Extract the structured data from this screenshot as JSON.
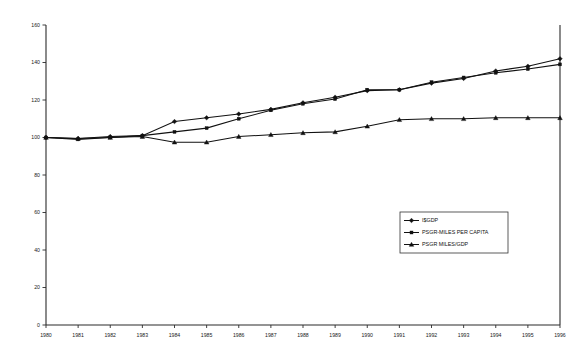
{
  "chart_data": {
    "type": "line",
    "title": "",
    "subtitle": "",
    "xlabel": "",
    "ylabel": "",
    "xlim": [
      1980,
      1996
    ],
    "ylim": [
      0,
      160
    ],
    "grid": false,
    "legend_position": "center-right",
    "x": [
      1980,
      1981,
      1982,
      1983,
      1984,
      1985,
      1986,
      1987,
      1988,
      1989,
      1990,
      1991,
      1992,
      1993,
      1994,
      1995,
      1996
    ],
    "x_tick_labels": [
      "1980",
      "1981",
      "1982",
      "1983",
      "1984",
      "1985",
      "1986",
      "1987",
      "1988",
      "1989",
      "1990",
      "1991",
      "1992",
      "1993",
      "1994",
      "1995",
      "1996"
    ],
    "y_tick_labels": [
      "0",
      "20",
      "40",
      "60",
      "80",
      "100",
      "120",
      "140",
      "160"
    ],
    "y_ticks": [
      0,
      20,
      40,
      60,
      80,
      100,
      120,
      140,
      160
    ],
    "series": [
      {
        "name": "I$GDP",
        "marker": "diamond",
        "values": [
          100,
          99.5,
          100.5,
          101,
          108.5,
          110.5,
          112.5,
          115,
          118.5,
          121.5,
          125,
          125.5,
          129,
          131.5,
          135.5,
          138,
          142
        ]
      },
      {
        "name": "PSGR-MILES PER CAPITA",
        "marker": "square",
        "values": [
          100,
          99,
          100,
          101,
          103,
          105,
          110,
          114.5,
          118,
          120.5,
          125.5,
          125.5,
          129.5,
          132,
          134.5,
          136.5,
          139
        ]
      },
      {
        "name": "PSGR MILES/GDP",
        "marker": "triangle",
        "values": [
          100,
          99.5,
          100,
          100.5,
          97.5,
          97.5,
          100.5,
          101.5,
          102.5,
          103,
          106,
          109.5,
          110,
          110,
          110.5,
          110.5,
          110.5
        ]
      }
    ]
  },
  "legend": {
    "entries": [
      {
        "label": "I$GDP"
      },
      {
        "label": "PSGR-MILES PER CAPITA"
      },
      {
        "label": "PSGR MILES/GDP"
      }
    ]
  }
}
